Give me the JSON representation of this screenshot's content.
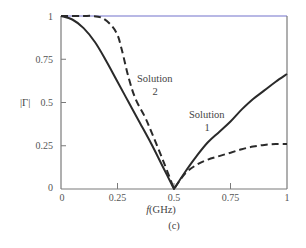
{
  "chart_data": {
    "type": "line",
    "title": "",
    "caption": "(c)",
    "xlabel": "f(GHz)",
    "xlabel_italic_part": "f",
    "xlabel_rest": "(GHz)",
    "ylabel": "|Γ|",
    "xlim": [
      0,
      1
    ],
    "ylim": [
      0,
      1
    ],
    "grid": false,
    "x_ticks": [
      0,
      0.25,
      0.5,
      0.75,
      1
    ],
    "x_tick_labels": [
      "0",
      "0.25",
      "0.5",
      "0.75",
      "1"
    ],
    "y_ticks": [
      0,
      0.25,
      0.5,
      0.75,
      1
    ],
    "y_tick_labels": [
      "0",
      "0.25",
      "0.5",
      "0.75",
      "1"
    ],
    "series": [
      {
        "name": "Solution 1",
        "style": "solid",
        "x": [
          0,
          0.05,
          0.1,
          0.15,
          0.2,
          0.25,
          0.3,
          0.35,
          0.4,
          0.45,
          0.5,
          0.55,
          0.6,
          0.65,
          0.7,
          0.75,
          0.8,
          0.85,
          0.9,
          0.95,
          1.0
        ],
        "values": [
          1.0,
          0.98,
          0.93,
          0.85,
          0.74,
          0.62,
          0.5,
          0.38,
          0.26,
          0.13,
          0.0,
          0.1,
          0.19,
          0.27,
          0.33,
          0.39,
          0.46,
          0.52,
          0.57,
          0.62,
          0.665
        ]
      },
      {
        "name": "Solution 2",
        "style": "dashed",
        "x": [
          0,
          0.05,
          0.1,
          0.14,
          0.18,
          0.22,
          0.25,
          0.27,
          0.3,
          0.33,
          0.37,
          0.4,
          0.45,
          0.5,
          0.55,
          0.6,
          0.65,
          0.7,
          0.75,
          0.8,
          0.85,
          0.9,
          0.95,
          1.0
        ],
        "values": [
          1.0,
          1.0,
          1.0,
          1.0,
          0.99,
          0.95,
          0.89,
          0.8,
          0.64,
          0.52,
          0.42,
          0.33,
          0.17,
          0.0,
          0.09,
          0.14,
          0.17,
          0.19,
          0.21,
          0.23,
          0.245,
          0.255,
          0.26,
          0.26
        ]
      }
    ],
    "annotations": [
      {
        "text_line1": "Solution",
        "text_line2": "2",
        "x": 0.39,
        "y": 0.74
      },
      {
        "text_line1": "Solution",
        "text_line2": "1",
        "x": 0.66,
        "y": 0.45
      }
    ]
  },
  "labels": {
    "ylabel": "|Γ|",
    "xlabel_f": "f",
    "xlabel_unit": "(GHz)",
    "caption": "(c)",
    "sol2_line1": "Solution",
    "sol2_line2": "2",
    "sol1_line1": "Solution",
    "sol1_line2": "1"
  },
  "colors": {
    "axis": "#7a7a7a",
    "top_border": "#a0a0dc",
    "curve": "#2a2a2a"
  }
}
